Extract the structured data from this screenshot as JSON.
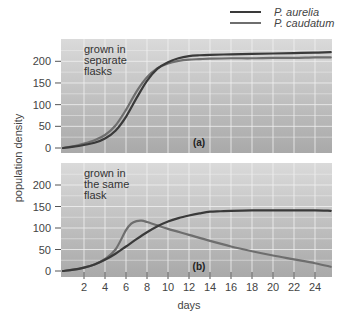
{
  "chart_data": [
    {
      "type": "line",
      "panel_label": "(a)",
      "annotation": "grown in separate flasks",
      "annotation_lines": [
        "grown in",
        "separate",
        "flasks"
      ],
      "xlabel": "days",
      "ylabel": "population density",
      "xlim": [
        0,
        25.5
      ],
      "ylim": [
        0,
        250
      ],
      "yticks": [
        0,
        50,
        100,
        150,
        200
      ],
      "xticks": [
        2,
        4,
        6,
        8,
        10,
        12,
        14,
        16,
        18,
        20,
        22,
        24
      ],
      "grid": true,
      "series": [
        {
          "name": "P. aurelia",
          "color": "#3a3a3a",
          "x": [
            0,
            1,
            2,
            3,
            4,
            5,
            6,
            7,
            8,
            9,
            10,
            11,
            12,
            13,
            14,
            16,
            18,
            20,
            22,
            24,
            25.5
          ],
          "y": [
            0,
            3,
            7,
            12,
            22,
            40,
            72,
            115,
            155,
            183,
            198,
            207,
            212,
            214,
            215,
            216,
            217,
            218,
            219,
            220,
            221
          ]
        },
        {
          "name": "P. caudatum",
          "color": "#6e6e6e",
          "x": [
            0,
            1,
            2,
            3,
            4,
            5,
            6,
            7,
            8,
            9,
            10,
            11,
            12,
            13,
            14,
            16,
            18,
            20,
            22,
            24,
            25.5
          ],
          "y": [
            0,
            4,
            10,
            18,
            30,
            52,
            88,
            130,
            163,
            184,
            195,
            201,
            204,
            205,
            206,
            207,
            207,
            208,
            208,
            209,
            209
          ]
        }
      ]
    },
    {
      "type": "line",
      "panel_label": "(b)",
      "annotation": "grown in the same flask",
      "annotation_lines": [
        "grown in",
        "the same",
        "flask"
      ],
      "xlabel": "days",
      "ylabel": "population density",
      "xlim": [
        0,
        25.5
      ],
      "ylim": [
        0,
        250
      ],
      "yticks": [
        0,
        50,
        100,
        150,
        200
      ],
      "xticks": [
        2,
        4,
        6,
        8,
        10,
        12,
        14,
        16,
        18,
        20,
        22,
        24
      ],
      "grid": true,
      "series": [
        {
          "name": "P. aurelia",
          "color": "#3a3a3a",
          "x": [
            0,
            1,
            2,
            3,
            4,
            5,
            6,
            7,
            8,
            9,
            10,
            11,
            12,
            13,
            14,
            15,
            16,
            18,
            20,
            22,
            24,
            25.5
          ],
          "y": [
            0,
            3,
            8,
            15,
            26,
            40,
            57,
            74,
            90,
            104,
            115,
            123,
            129,
            134,
            138,
            139,
            140,
            141,
            141,
            141,
            141,
            140
          ]
        },
        {
          "name": "P. caudatum",
          "color": "#6e6e6e",
          "x": [
            0,
            1,
            2,
            3,
            4,
            5,
            6,
            6.5,
            7,
            7.5,
            8,
            9,
            10,
            12,
            14,
            16,
            18,
            20,
            22,
            24,
            25.5
          ],
          "y": [
            0,
            3,
            8,
            15,
            28,
            50,
            95,
            110,
            116,
            117,
            114,
            106,
            98,
            84,
            70,
            57,
            46,
            36,
            27,
            18,
            10
          ]
        }
      ]
    }
  ],
  "legend": [
    {
      "label": "P. aurelia",
      "color": "#3a3a3a"
    },
    {
      "label": "P. caudatum",
      "color": "#6e6e6e"
    }
  ],
  "axes": {
    "ylabel": "population density",
    "xlabel": "days"
  }
}
